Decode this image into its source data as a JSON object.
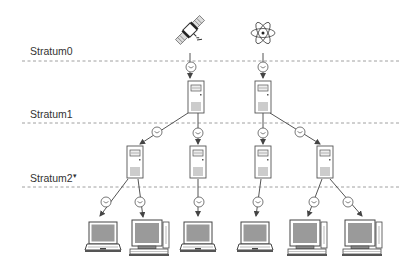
{
  "diagram": {
    "strata": [
      {
        "label": "Stratum0",
        "line_y": 61,
        "label_y": 46
      },
      {
        "label": "Stratum1",
        "line_y": 123,
        "label_y": 108
      },
      {
        "label": "Stratum2",
        "line_y": 187,
        "label_y": 172,
        "marker": "▾"
      }
    ],
    "sources": [
      {
        "type": "satellite",
        "x": 190,
        "y": 30
      },
      {
        "type": "atomic-clock",
        "x": 263,
        "y": 32
      }
    ],
    "stratum1_servers": [
      {
        "x": 196,
        "y": 82
      },
      {
        "x": 263,
        "y": 82
      }
    ],
    "stratum2_servers": [
      {
        "x": 135,
        "y": 147
      },
      {
        "x": 198,
        "y": 147
      },
      {
        "x": 263,
        "y": 147
      },
      {
        "x": 325,
        "y": 147
      }
    ],
    "clients": [
      {
        "type": "laptop",
        "x": 103,
        "y": 240
      },
      {
        "type": "desktop",
        "x": 150,
        "y": 238
      },
      {
        "type": "laptop",
        "x": 198,
        "y": 240
      },
      {
        "type": "laptop",
        "x": 255,
        "y": 240
      },
      {
        "type": "desktop",
        "x": 310,
        "y": 238
      },
      {
        "type": "desktop",
        "x": 365,
        "y": 238
      }
    ],
    "colors": {
      "line": "#555555",
      "dash": "#888888",
      "screen": "#9a9a9a",
      "outline": "#444444"
    }
  }
}
